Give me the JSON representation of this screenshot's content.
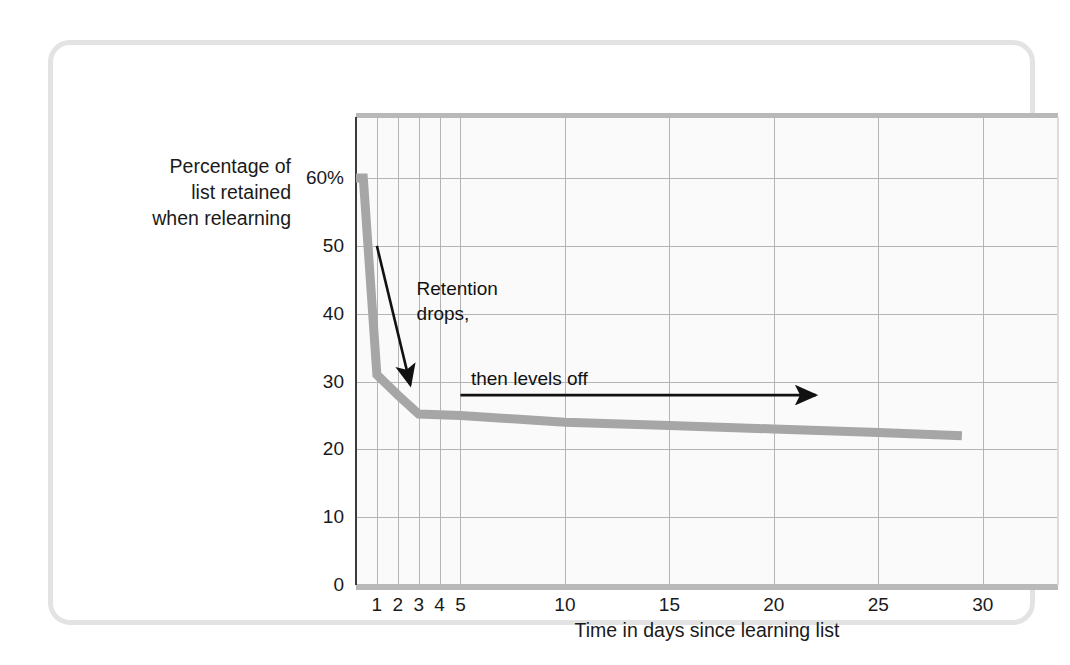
{
  "figure": {
    "border_color": "#e3e3e3",
    "plot_bg": "#fafafa",
    "grid_color": "#b4b4b4",
    "curve_color": "#a6a6a6",
    "annotation_color": "#111111"
  },
  "axes": {
    "ylabel": "Percentage of\nlist retained\nwhen relearning",
    "xlabel": "Time in days since learning list"
  },
  "annotations": {
    "drop": "Retention\ndrops,",
    "level": "then levels off"
  },
  "chart_data": {
    "type": "line",
    "title": "",
    "xlabel": "Time in days since learning list",
    "ylabel": "Percentage of list retained when relearning",
    "xlim": [
      0,
      33.6
    ],
    "ylim": [
      0,
      69
    ],
    "grid": true,
    "legend": "none",
    "ytick_values": [
      0,
      10,
      20,
      30,
      40,
      50,
      60
    ],
    "ytick_labels": [
      "0",
      "10",
      "20",
      "30",
      "40",
      "50",
      "60%"
    ],
    "xtick_values": [
      1,
      2,
      3,
      4,
      5,
      10,
      15,
      20,
      25,
      30
    ],
    "xtick_labels": [
      "1",
      "2",
      "3",
      "4",
      "5",
      "10",
      "15",
      "20",
      "25",
      "30"
    ],
    "x_gridlines": [
      1,
      2,
      3,
      4,
      5,
      10,
      15,
      20,
      25,
      30
    ],
    "y_gridlines": [
      10,
      20,
      30,
      40,
      50,
      60
    ],
    "series": [
      {
        "name": "Savings (percentage of list retained when relearning)",
        "x": [
          0,
          0.35,
          1,
          2,
          3,
          5,
          10,
          15,
          20,
          25,
          29
        ],
        "values": [
          60,
          60,
          31,
          28,
          25.2,
          25,
          24,
          23.5,
          23,
          22.5,
          22
        ]
      }
    ],
    "annotations": [
      {
        "text": "Retention\ndrops,",
        "arrow_from_x": 1.0,
        "arrow_from_y": 50.0,
        "arrow_to_x": 2.6,
        "arrow_to_y": 29.5
      },
      {
        "text": "then levels off",
        "arrow_from_x": 5.0,
        "arrow_from_y": 28.0,
        "arrow_to_x": 22.0,
        "arrow_to_y": 28.0
      }
    ]
  }
}
